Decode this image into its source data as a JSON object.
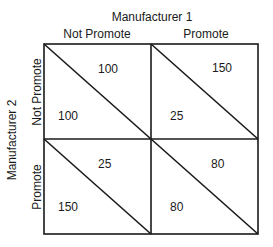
{
  "column_player": {
    "label": "Manufacturer 1",
    "strategies": [
      "Not Promote",
      "Promote"
    ]
  },
  "row_player": {
    "label": "Manufacturer 2",
    "strategies": [
      "Not Promote",
      "Promote"
    ]
  },
  "cells": [
    {
      "row": "Not Promote",
      "col": "Not Promote",
      "upper_right": "100",
      "lower_left": "100"
    },
    {
      "row": "Not Promote",
      "col": "Promote",
      "upper_right": "150",
      "lower_left": "25"
    },
    {
      "row": "Promote",
      "col": "Not Promote",
      "upper_right": "25",
      "lower_left": "150"
    },
    {
      "row": "Promote",
      "col": "Promote",
      "upper_right": "80",
      "lower_left": "80"
    }
  ],
  "colors": {
    "line": "#1a1a1a",
    "background": "#ffffff"
  }
}
